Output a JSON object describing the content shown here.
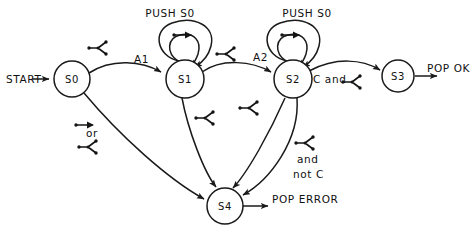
{
  "diagram": {
    "ink_color": "#1a1a1a",
    "background_color": "#ffffff",
    "nodes": [
      {
        "id": "S0",
        "label": "S0",
        "cx": 72,
        "cy": 79,
        "r": 18
      },
      {
        "id": "S1",
        "label": "S1",
        "cx": 185,
        "cy": 79,
        "r": 19
      },
      {
        "id": "S2",
        "label": "S2",
        "cx": 293,
        "cy": 79,
        "r": 19
      },
      {
        "id": "S3",
        "label": "S3",
        "cx": 398,
        "cy": 76,
        "r": 16
      },
      {
        "id": "S4",
        "label": "S4",
        "cx": 225,
        "cy": 206,
        "r": 18
      }
    ],
    "edge_labels": {
      "a1": "A1",
      "a2": "A2",
      "c_and": "C and",
      "and": "and",
      "not_c": "not C",
      "or": "or"
    },
    "io_labels": {
      "start": "START",
      "pop_ok": "POP OK",
      "pop_error": "POP ERROR"
    },
    "self_loop_labels": {
      "push_s0_left": "PUSH S0",
      "push_s0_right": "PUSH S0"
    },
    "glyph_name": "fork-condition-glyph",
    "glyph_count": 9,
    "arrow_glyph_name": "short-arrow-glyph"
  }
}
